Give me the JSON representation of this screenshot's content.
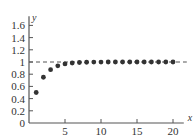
{
  "chart_data": {
    "type": "scatter",
    "title": "",
    "xlabel": "x",
    "ylabel": "y",
    "xlim": [
      0,
      21.5
    ],
    "ylim": [
      0,
      1.75
    ],
    "x_ticks": [
      5,
      10,
      15,
      20
    ],
    "y_ticks": [
      0,
      0.2,
      0.4,
      0.6,
      0.8,
      1,
      1.2,
      1.4,
      1.6
    ],
    "y_tick_labels": [
      "0",
      "0.2",
      "0.4",
      "0.6",
      "0.8",
      "1",
      "1.2",
      "1.4",
      "1.6"
    ],
    "grid": false,
    "legend": null,
    "annotations": [
      {
        "type": "hline",
        "y": 1,
        "style": "dashed"
      }
    ],
    "series": [
      {
        "name": "sequence",
        "x": [
          1,
          2,
          3,
          4,
          5,
          6,
          7,
          8,
          9,
          10,
          11,
          12,
          13,
          14,
          15,
          16,
          17,
          18,
          19,
          20
        ],
        "y": [
          0.5,
          0.75,
          0.875,
          0.9375,
          0.96875,
          0.984,
          0.992,
          0.996,
          0.998,
          0.999,
          1.0,
          1.0,
          1.0,
          1.0,
          1.0,
          1.0,
          1.0,
          1.0,
          1.0,
          1.0
        ]
      }
    ]
  },
  "colors": {
    "axis": "#555555",
    "points": "#333333",
    "dashed": "#555555"
  }
}
